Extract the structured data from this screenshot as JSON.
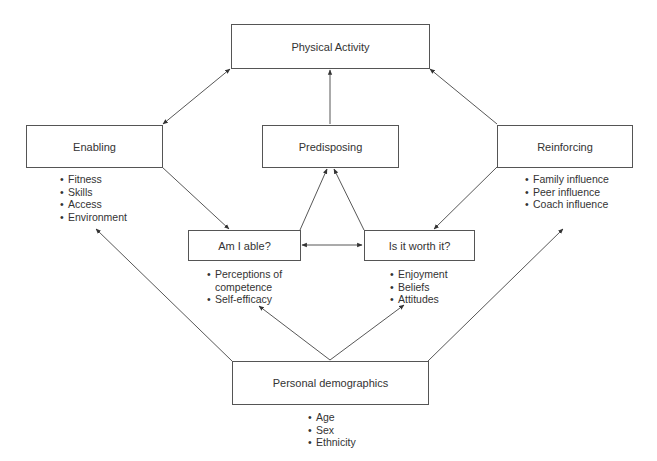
{
  "diagram": {
    "nodes": {
      "physical_activity": {
        "label": "Physical Activity"
      },
      "enabling": {
        "label": "Enabling",
        "items": [
          "Fitness",
          "Skills",
          "Access",
          "Environment"
        ]
      },
      "predisposing": {
        "label": "Predisposing"
      },
      "reinforcing": {
        "label": "Reinforcing",
        "items": [
          "Family influence",
          "Peer influence",
          "Coach influence"
        ]
      },
      "am_i_able": {
        "label": "Am I able?",
        "items": [
          "Perceptions of",
          "competence",
          "Self-efficacy"
        ]
      },
      "is_it_worth_it": {
        "label": "Is it worth it?",
        "items": [
          "Enjoyment",
          "Beliefs",
          "Attitudes"
        ]
      },
      "personal_demographics": {
        "label": "Personal demographics",
        "items": [
          "Age",
          "Sex",
          "Ethnicity"
        ]
      }
    },
    "edges": [
      {
        "from": "physical_activity",
        "to": "enabling",
        "bidirectional": true
      },
      {
        "from": "predisposing",
        "to": "physical_activity",
        "bidirectional": false
      },
      {
        "from": "reinforcing",
        "to": "physical_activity",
        "bidirectional": false
      },
      {
        "from": "enabling",
        "to": "am_i_able",
        "bidirectional": false
      },
      {
        "from": "reinforcing",
        "to": "is_it_worth_it",
        "bidirectional": false
      },
      {
        "from": "am_i_able",
        "to": "predisposing",
        "bidirectional": false
      },
      {
        "from": "is_it_worth_it",
        "to": "predisposing",
        "bidirectional": false
      },
      {
        "from": "am_i_able",
        "to": "is_it_worth_it",
        "bidirectional": true
      },
      {
        "from": "personal_demographics",
        "to": "enabling",
        "bidirectional": false
      },
      {
        "from": "personal_demographics",
        "to": "am_i_able",
        "bidirectional": false
      },
      {
        "from": "personal_demographics",
        "to": "is_it_worth_it",
        "bidirectional": false
      },
      {
        "from": "personal_demographics",
        "to": "reinforcing",
        "bidirectional": false
      }
    ]
  }
}
